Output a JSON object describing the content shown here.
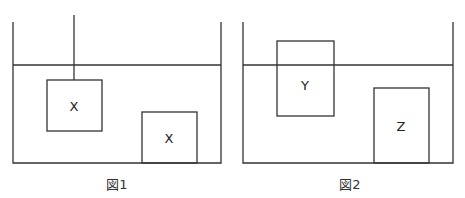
{
  "figures": [
    {
      "caption": "図1",
      "objects": [
        {
          "label": "X"
        },
        {
          "label": "X"
        }
      ]
    },
    {
      "caption": "図2",
      "objects": [
        {
          "label": "Y"
        },
        {
          "label": "Z"
        }
      ]
    }
  ],
  "colors": {
    "line": "#333333",
    "background": "#ffffff"
  }
}
